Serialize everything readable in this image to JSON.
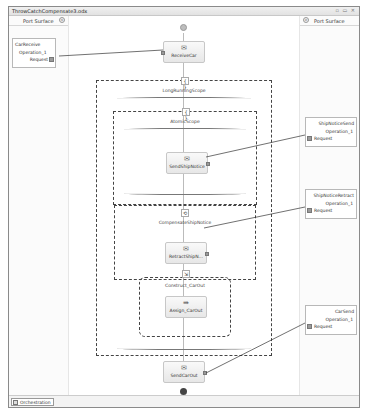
{
  "window": {
    "title": "ThrowCatchCompensate3.odx",
    "controls": "▫ ▭ ✕"
  },
  "port_surface_left": {
    "label": "Port Surface",
    "collapse_glyph": "«",
    "ports": [
      {
        "name": "CarReceive",
        "operation": "Operation_1",
        "message": "Request"
      }
    ]
  },
  "port_surface_right": {
    "label": "Port Surface",
    "collapse_glyph": "»",
    "ports": [
      {
        "name": "ShipNoticeSend",
        "operation": "Operation_1",
        "message": "Request"
      },
      {
        "name": "ShipNoticeRetract",
        "operation": "Operation_1",
        "message": "Request"
      },
      {
        "name": "CarSend",
        "operation": "Operation_1",
        "message": "Request"
      }
    ]
  },
  "orchestration": {
    "shapes": {
      "receive": {
        "label": "ReceiveCar",
        "icon": "receive-icon"
      },
      "long_scope": {
        "label": "LongRunningScope",
        "icon": "{ }"
      },
      "atomic_scope": {
        "label": "AtomicScope",
        "icon": "{ }"
      },
      "send_ship": {
        "label": "SendShipNotice",
        "icon": "send-icon"
      },
      "compensate": {
        "label": "CompensateShipNotice",
        "icon": "compensate-icon"
      },
      "retract": {
        "label": "RetractShipN...",
        "icon": "send-icon"
      },
      "construct": {
        "label": "Construct_CarOut",
        "icon": "construct-icon"
      },
      "assign": {
        "label": "Assign_CarOut",
        "icon": "assign-icon"
      },
      "send_car": {
        "label": "SendCarOut",
        "icon": "send-icon"
      }
    }
  },
  "statusbar": {
    "tab_label": "Orchestration"
  }
}
